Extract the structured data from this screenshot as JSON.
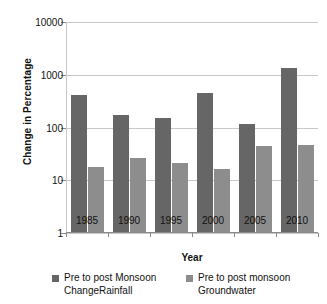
{
  "chart_data": {
    "type": "bar",
    "title": "",
    "xlabel": "Year",
    "ylabel": "Change in Percentage",
    "categories": [
      "1985",
      "1990",
      "1995",
      "2000",
      "2005",
      "2010"
    ],
    "yscale": "log",
    "ylim": [
      1,
      10000
    ],
    "yticks": [
      1,
      10,
      100,
      1000,
      10000
    ],
    "ytick_labels": [
      "1",
      "10",
      "100",
      "1000",
      "10000"
    ],
    "grid": true,
    "legend_position": "bottom",
    "series": [
      {
        "name": "Pre to post Monsoon ChangeRainfall",
        "legend_line1": "Pre to post Monsoon",
        "legend_line2": "ChangeRainfall",
        "color": "#666666",
        "values": [
          420,
          175,
          150,
          460,
          115,
          1350
        ]
      },
      {
        "name": "Pre to post monsoon Groundwater",
        "legend_line1": "Pre to post monsoon",
        "legend_line2": "Groundwater",
        "color": "#8d8d8d",
        "values": [
          18,
          27,
          21,
          16,
          45,
          46
        ]
      }
    ]
  }
}
